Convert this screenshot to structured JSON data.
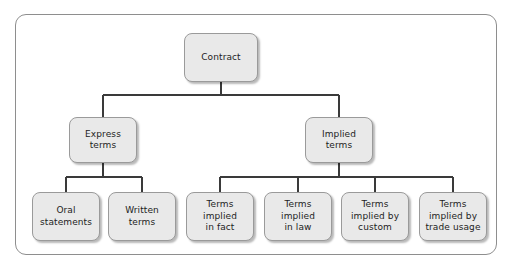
{
  "diagram": {
    "type": "hierarchy-tree",
    "orientation": "top-down",
    "frame": {
      "shape": "rounded-rectangle",
      "border_color": "#8e8e8e",
      "background_color": "#ffffff"
    },
    "style": {
      "node_fill": "#e9e9e9",
      "node_border": "#9a9a9a",
      "node_text_color": "#1d1d1d",
      "connector_color": "#3a3a3a",
      "node_shape": "rounded-rectangle",
      "has_drop_shadow": true
    },
    "levels": [
      {
        "level": 1,
        "nodes": [
          {
            "id": "contract",
            "label": "Contract"
          }
        ]
      },
      {
        "level": 2,
        "nodes": [
          {
            "id": "express-terms",
            "label": "Express\nterms",
            "parent": "contract"
          },
          {
            "id": "implied-terms",
            "label": "Implied\nterms",
            "parent": "contract"
          }
        ]
      },
      {
        "level": 3,
        "nodes": [
          {
            "id": "oral-statements",
            "label": "Oral\nstatements",
            "parent": "express-terms"
          },
          {
            "id": "written-terms",
            "label": "Written\nterms",
            "parent": "express-terms"
          },
          {
            "id": "terms-implied-in-fact",
            "label": "Terms\nimplied\nin fact",
            "parent": "implied-terms"
          },
          {
            "id": "terms-implied-in-law",
            "label": "Terms\nimplied\nin law",
            "parent": "implied-terms"
          },
          {
            "id": "terms-implied-by-custom",
            "label": "Terms\nimplied by\ncustom",
            "parent": "implied-terms"
          },
          {
            "id": "terms-implied-by-trade-usage",
            "label": "Terms\nimplied by\ntrade usage",
            "parent": "implied-terms"
          }
        ]
      }
    ],
    "nodes": {
      "contract": "Contract",
      "express_terms": "Express\nterms",
      "implied_terms": "Implied\nterms",
      "oral_statements": "Oral\nstatements",
      "written_terms": "Written\nterms",
      "terms_implied_in_fact": "Terms\nimplied\nin fact",
      "terms_implied_in_law": "Terms\nimplied\nin law",
      "terms_implied_by_custom": "Terms\nimplied by\ncustom",
      "terms_implied_by_trade_usage": "Terms\nimplied by\ntrade usage"
    }
  }
}
